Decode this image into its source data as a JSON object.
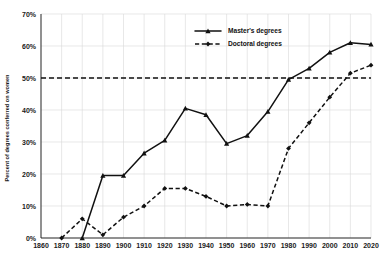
{
  "chart_data": {
    "type": "line",
    "title": "",
    "xlabel": "",
    "ylabel": "Percent of degrees conferred on women",
    "xlim": [
      1860,
      2020
    ],
    "ylim": [
      0,
      70
    ],
    "grid": true,
    "legend_position": "top-center-right",
    "x": [
      1860,
      1870,
      1880,
      1890,
      1900,
      1910,
      1920,
      1930,
      1940,
      1950,
      1960,
      1970,
      1980,
      1990,
      2000,
      2010,
      2020
    ],
    "xtick_labels": [
      "1860",
      "1870",
      "1880",
      "1890",
      "1900",
      "1910",
      "1920",
      "1930",
      "1940",
      "1950",
      "1960",
      "1970",
      "1980",
      "1990",
      "2000",
      "2010",
      "2020"
    ],
    "ytick_labels": [
      "0%",
      "10%",
      "20%",
      "30%",
      "40%",
      "50%",
      "60%",
      "70%"
    ],
    "ytick_values": [
      0,
      10,
      20,
      30,
      40,
      50,
      60,
      70
    ],
    "series": [
      {
        "name": "Master's degrees",
        "style": "solid",
        "marker": "triangle",
        "points": [
          {
            "x": 1880,
            "y": 0.0
          },
          {
            "x": 1890,
            "y": 19.5
          },
          {
            "x": 1900,
            "y": 19.5
          },
          {
            "x": 1910,
            "y": 26.5
          },
          {
            "x": 1920,
            "y": 30.5
          },
          {
            "x": 1930,
            "y": 40.5
          },
          {
            "x": 1940,
            "y": 38.5
          },
          {
            "x": 1950,
            "y": 29.5
          },
          {
            "x": 1960,
            "y": 32.0
          },
          {
            "x": 1970,
            "y": 39.5
          },
          {
            "x": 1980,
            "y": 49.5
          },
          {
            "x": 1990,
            "y": 53.0
          },
          {
            "x": 2000,
            "y": 58.0
          },
          {
            "x": 2010,
            "y": 61.0
          },
          {
            "x": 2020,
            "y": 60.5
          }
        ]
      },
      {
        "name": "Doctoral degrees",
        "style": "dashed",
        "marker": "diamond",
        "points": [
          {
            "x": 1870,
            "y": 0.0
          },
          {
            "x": 1880,
            "y": 6.0
          },
          {
            "x": 1890,
            "y": 1.0
          },
          {
            "x": 1900,
            "y": 6.5
          },
          {
            "x": 1910,
            "y": 10.0
          },
          {
            "x": 1920,
            "y": 15.5
          },
          {
            "x": 1930,
            "y": 15.5
          },
          {
            "x": 1940,
            "y": 13.0
          },
          {
            "x": 1950,
            "y": 10.0
          },
          {
            "x": 1960,
            "y": 10.5
          },
          {
            "x": 1970,
            "y": 10.0
          },
          {
            "x": 1980,
            "y": 28.0
          },
          {
            "x": 1990,
            "y": 36.0
          },
          {
            "x": 2000,
            "y": 44.0
          },
          {
            "x": 2010,
            "y": 51.5
          },
          {
            "x": 2020,
            "y": 54.0
          }
        ]
      }
    ],
    "reference_lines": [
      {
        "name": "fifty-percent-parity-line",
        "y": 50,
        "style": "dashed"
      }
    ],
    "colors": {
      "line": "#111111",
      "grid": "#d9d9d9",
      "axis": "#1a1a1a",
      "background": "#ffffff"
    }
  },
  "legend": {
    "items": [
      {
        "label": "Master's degrees"
      },
      {
        "label": "Doctoral degrees"
      }
    ]
  },
  "axes": {
    "y_title": "Percent of degrees conferred on women"
  }
}
